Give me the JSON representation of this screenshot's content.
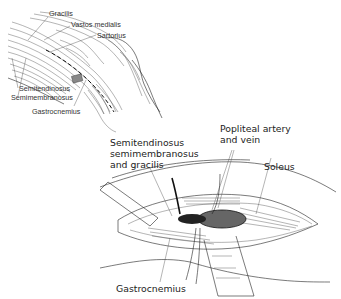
{
  "figure": {
    "inset": {
      "labels": {
        "gracilis": "Gracilis",
        "vastus_medialis": "Vastos medialis",
        "sartorius": "Sartorius",
        "semitendinosus": "Semitendinosus",
        "semimembranosus": "Semimembranosus",
        "gastrocnemius": "Gastrocnemius"
      }
    },
    "main": {
      "labels": {
        "hamstrings_line1": "Semitendinosus",
        "hamstrings_line2": "semimembranosus",
        "hamstrings_line3": "and gracilis",
        "popliteal_line1": "Popliteal artery",
        "popliteal_line2": "and vein",
        "soleus": "Soleus",
        "gastrocnemius": "Gastrocnemius"
      }
    }
  }
}
